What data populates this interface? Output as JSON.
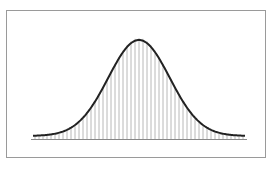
{
  "chart_data": {
    "type": "bar",
    "subtype": "histogram-with-normal-curve-overlay",
    "title": "",
    "xlabel": "",
    "ylabel": "",
    "grid": false,
    "legend": null,
    "x_range_px": [
      33,
      245
    ],
    "baseline_y_px": 139,
    "peak": {
      "x_px": 140,
      "y_px": 40
    },
    "distribution": {
      "shape": "normal",
      "mean_relative": 0.5,
      "sd_relative": 0.145,
      "peak_height_relative": 1.0
    },
    "bins": 53,
    "bar_color": "#b8b8b8",
    "curve_color": "#222222",
    "frame_color": "#9a9a9a",
    "baseline_color": "#888888"
  }
}
